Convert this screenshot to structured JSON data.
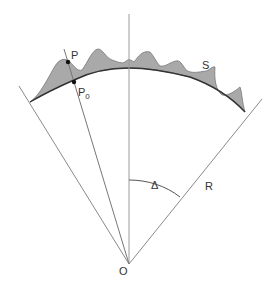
{
  "diagram": {
    "labels": {
      "P": "P",
      "P0_main": "P",
      "P0_sub": "0",
      "S": "S",
      "R": "R",
      "Delta": "Δ",
      "O": "O"
    },
    "colors": {
      "line": "#8a8a8a",
      "fill": "#a9a9a9",
      "arc": "#333333",
      "point": "#111111",
      "text": "#333333"
    }
  }
}
